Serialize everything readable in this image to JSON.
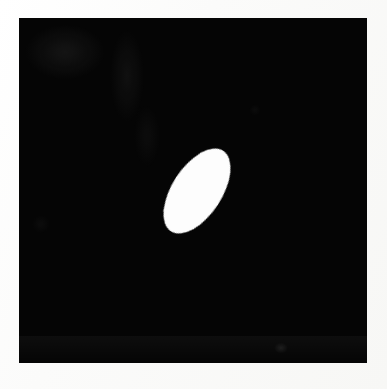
{
  "image": {
    "title": "Binary mask image with single bright elliptical region",
    "width": 387,
    "height": 389,
    "background_color": "#fdfdfc",
    "alt_text": "Black rectangular field containing one white tilted ellipse near the center"
  },
  "plate": {
    "name": "dark-field",
    "color": "#050505",
    "x": 19,
    "y": 18,
    "width": 348,
    "height": 345,
    "notes": "near-black photographic plate with faint gray emulsion smudges in the upper-left"
  },
  "ellipse": {
    "name": "bright-ellipse",
    "fill_color": "#fdfdfd",
    "center_x": 197,
    "center_y": 191,
    "major_axis": 96,
    "minor_axis": 50,
    "rotation_deg": -57,
    "bbox": {
      "left": 155,
      "top": 151,
      "right": 240,
      "bottom": 232
    }
  },
  "chart_data": {
    "type": "scatter",
    "title": "Binary mask image with single bright elliptical region",
    "xlabel": "x (pixels)",
    "ylabel": "y (pixels)",
    "xlim": [
      0,
      387
    ],
    "ylim": [
      0,
      389
    ],
    "grid": false,
    "legend_position": "none",
    "series": [
      {
        "name": "bright-ellipse",
        "shape": "ellipse",
        "color": "#fdfdfd",
        "x": [
          197
        ],
        "y": [
          191
        ],
        "major_axis": 96,
        "minor_axis": 50,
        "rotation_deg": -57,
        "area_px": 3770
      }
    ],
    "annotations": [
      {
        "label": "dark-field",
        "x": 19,
        "y": 18,
        "width": 348,
        "height": 345,
        "color": "#050505"
      }
    ]
  }
}
